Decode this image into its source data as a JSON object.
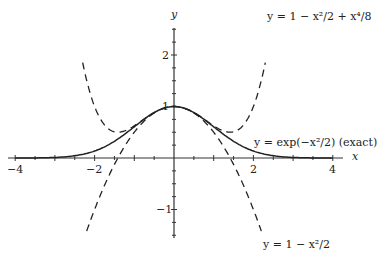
{
  "chart_data": {
    "type": "line",
    "title": "",
    "xlabel": "x",
    "ylabel": "y",
    "xlim": [
      -4.2,
      4.2
    ],
    "ylim": [
      -1.6,
      2.6
    ],
    "x_ticks": [
      "-4",
      "-2",
      "2",
      "4"
    ],
    "y_ticks": [
      "2",
      "1",
      "-1"
    ],
    "grid": false,
    "legend": "none (inline annotations)",
    "series": [
      {
        "name": "y = exp(-x^2/2) (exact)",
        "style": "solid",
        "function": "exp(-x^2/2)",
        "x_range": [
          -4,
          4
        ],
        "x": [
          -4,
          -3,
          -2,
          -1.5,
          -1,
          -0.5,
          0,
          0.5,
          1,
          1.5,
          2,
          3,
          4
        ],
        "y": [
          0.0003,
          0.011,
          0.135,
          0.325,
          0.607,
          0.882,
          1.0,
          0.882,
          0.607,
          0.325,
          0.135,
          0.011,
          0.0003
        ]
      },
      {
        "name": "y = 1 - x^2/2 + x^4/8",
        "style": "dashed",
        "function": "1 - x^2/2 + x^4/8",
        "x_range": [
          -2.3,
          2.3
        ],
        "x": [
          -2.3,
          -2,
          -1.5,
          -1,
          -0.5,
          0,
          0.5,
          1,
          1.5,
          2,
          2.3
        ],
        "y": [
          1.85,
          1.0,
          0.508,
          0.625,
          0.883,
          1.0,
          0.883,
          0.625,
          0.508,
          1.0,
          1.85
        ]
      },
      {
        "name": "y = 1 - x^2/2",
        "style": "dashed",
        "function": "1 - x^2/2",
        "x_range": [
          -2.2,
          2.2
        ],
        "x": [
          -2.2,
          -2,
          -1.5,
          -1,
          -0.5,
          0,
          0.5,
          1,
          1.5,
          2,
          2.2
        ],
        "y": [
          -1.42,
          -1.0,
          -0.125,
          0.5,
          0.875,
          1.0,
          0.875,
          0.5,
          -0.125,
          -1.0,
          -1.42
        ]
      }
    ],
    "annotations": [
      "y = 1 − x²/2 + x⁴/8",
      "y = exp(−x²/2) (exact)",
      "y = 1 − x²/2"
    ]
  },
  "labels": {
    "x_axis": "x",
    "y_axis": "y",
    "tick_xm4": "−4",
    "tick_xm2": "−2",
    "tick_x2": "2",
    "tick_x4": "4",
    "tick_y2": "2",
    "tick_y1": "1",
    "tick_ym1": "−1",
    "ann_quartic": "y = 1 − x²/2 + x⁴/8",
    "ann_exact": "y = exp(−x²/2) (exact)",
    "ann_quadratic": "y = 1 − x²/2"
  }
}
